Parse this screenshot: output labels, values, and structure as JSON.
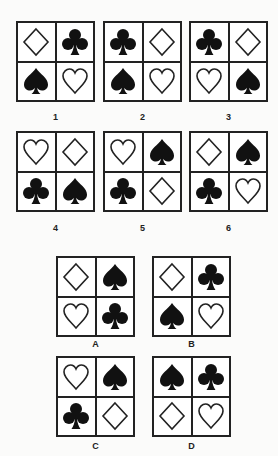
{
  "puzzle": {
    "series": [
      {
        "label": "1",
        "cells": [
          "diamond",
          "club",
          "spade",
          "heart"
        ]
      },
      {
        "label": "2",
        "cells": [
          "club",
          "diamond",
          "spade",
          "heart"
        ]
      },
      {
        "label": "3",
        "cells": [
          "club",
          "diamond",
          "heart",
          "spade"
        ]
      },
      {
        "label": "4",
        "cells": [
          "heart",
          "diamond",
          "club",
          "spade"
        ]
      },
      {
        "label": "5",
        "cells": [
          "heart",
          "spade",
          "club",
          "diamond"
        ]
      },
      {
        "label": "6",
        "cells": [
          "diamond",
          "spade",
          "club",
          "heart"
        ]
      }
    ],
    "options": [
      {
        "label": "A",
        "cells": [
          "diamond",
          "spade",
          "heart",
          "club"
        ]
      },
      {
        "label": "B",
        "cells": [
          "diamond",
          "club",
          "spade",
          "heart"
        ]
      },
      {
        "label": "C",
        "cells": [
          "heart",
          "spade",
          "club",
          "diamond"
        ]
      },
      {
        "label": "D",
        "cells": [
          "spade",
          "club",
          "diamond",
          "heart"
        ]
      }
    ]
  },
  "colors": {
    "outline": "#222222",
    "fill": "#111111",
    "background": "#fbfbfa"
  }
}
